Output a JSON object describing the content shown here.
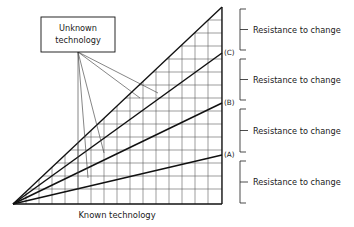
{
  "figure": {
    "type": "diagram",
    "axis": {
      "x_label": "Known technology"
    },
    "callout": {
      "line1": "Unknown",
      "line2": "technology"
    },
    "band_markers": [
      {
        "id": "marker-c",
        "label": "(C)"
      },
      {
        "id": "marker-b",
        "label": "(B)"
      },
      {
        "id": "marker-a",
        "label": "(A)"
      }
    ],
    "brackets": [
      {
        "id": "bracket-1",
        "label": "Resistance to change"
      },
      {
        "id": "bracket-2",
        "label": "Resistance to change"
      },
      {
        "id": "bracket-3",
        "label": "Resistance to change"
      },
      {
        "id": "bracket-4",
        "label": "Resistance to change"
      }
    ],
    "colors": {
      "background": "#ffffff",
      "grid": "#5a5a5a",
      "frame": "#111111",
      "band": "#111111",
      "leader": "#444444",
      "bracket": "#2a2a2a",
      "text": "#1a1a1a"
    },
    "geometry": {
      "origin_x": 13,
      "origin_y": 204,
      "apex_x": 222,
      "apex_y": 7,
      "axis_x": 222,
      "grid_columns": 16,
      "grid_rows": 15,
      "band_end_c_y": 53,
      "band_end_b_y": 103,
      "band_end_a_y": 155
    }
  }
}
